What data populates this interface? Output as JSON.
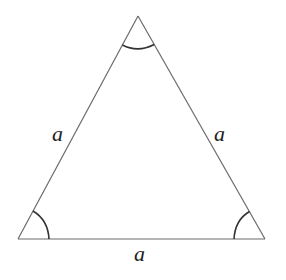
{
  "diagram": {
    "type": "equilateral-triangle",
    "vertices": {
      "top": {
        "x": 138,
        "y": 16
      },
      "bottom_left": {
        "x": 18,
        "y": 239
      },
      "bottom_right": {
        "x": 265,
        "y": 239
      }
    },
    "side_labels": {
      "left": "a",
      "right": "a",
      "bottom": "a"
    },
    "angle_marks": [
      "top",
      "bottom_left",
      "bottom_right"
    ],
    "colors": {
      "line": "#6a6a6a",
      "arc": "#333333",
      "label": "#222222",
      "background": "#ffffff"
    }
  }
}
